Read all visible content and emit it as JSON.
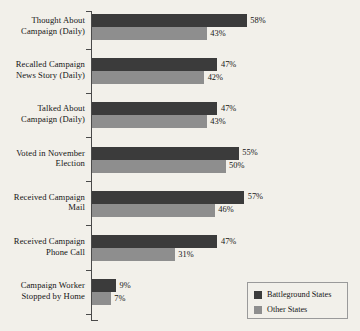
{
  "chart_data": {
    "type": "bar",
    "orientation": "horizontal",
    "title": "",
    "subtitle": "",
    "xlabel": "",
    "ylabel": "",
    "grid": false,
    "xlim": [
      0,
      60
    ],
    "value_suffix": "%",
    "legend_position": "bottom-right",
    "categories": [
      "Thought About\nCampaign (Daily)",
      "Recalled Campaign\nNews Story (Daily)",
      "Talked About\nCampaign (Daily)",
      "Voted in November\nElection",
      "Received Campaign\nMail",
      "Received Campaign\nPhone Call",
      "Campaign Worker\nStopped by Home"
    ],
    "series": [
      {
        "name": "Battleground States",
        "color": "#3b3b3b",
        "values": [
          58,
          47,
          47,
          55,
          57,
          47,
          9
        ],
        "labels": [
          "58%",
          "47%",
          "47%",
          "55%",
          "57%",
          "47%",
          "9%"
        ]
      },
      {
        "name": "Other States",
        "color": "#8e8e8e",
        "values": [
          43,
          42,
          43,
          50,
          46,
          31,
          7
        ],
        "labels": [
          "43%",
          "42%",
          "43%",
          "50%",
          "46%",
          "31%",
          "7%"
        ]
      }
    ]
  },
  "categories_display": [
    {
      "line1": "Thought About",
      "line2": "Campaign (Daily)"
    },
    {
      "line1": "Recalled Campaign",
      "line2": "News Story (Daily)"
    },
    {
      "line1": "Talked About",
      "line2": "Campaign (Daily)"
    },
    {
      "line1": "Voted in November",
      "line2": "Election"
    },
    {
      "line1": "Received Campaign",
      "line2": "Mail"
    },
    {
      "line1": "Received Campaign",
      "line2": "Phone Call"
    },
    {
      "line1": "Campaign Worker",
      "line2": "Stopped by Home"
    }
  ],
  "legend": {
    "items": [
      {
        "label": "Battleground States",
        "color": "#3b3b3b"
      },
      {
        "label": "Other States",
        "color": "#8e8e8e"
      }
    ]
  },
  "colors": {
    "background": "#f2f0ea",
    "axis": "#4a4a4a",
    "text": "#151515",
    "series_dark": "#3b3b3b",
    "series_light": "#8e8e8e",
    "legend_border": "#9a9a9a"
  }
}
